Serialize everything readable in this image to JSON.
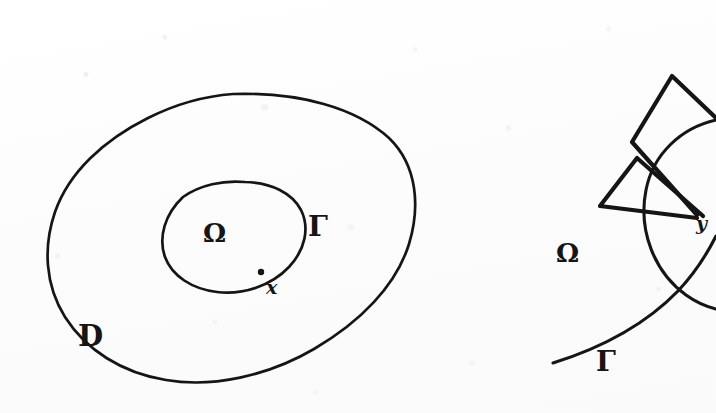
{
  "figure": {
    "background_color": "#fdfdfd",
    "ink_color": "#151515",
    "width": 716,
    "height": 413
  },
  "left_panel": {
    "name": "domain-overview",
    "labels": {
      "outer_domain": "D",
      "inner_domain": "Ω",
      "boundary": "Γ",
      "boundary_point": "x"
    },
    "label_positions": {
      "outer_domain": {
        "x": 78,
        "y": 322
      },
      "inner_domain": {
        "x": 203,
        "y": 220
      },
      "boundary": {
        "x": 308,
        "y": 213
      },
      "boundary_point": {
        "x": 266,
        "y": 278
      }
    },
    "shapes": [
      {
        "name": "outer-blob-D",
        "kind": "closed-freehand-curve",
        "description": "large irregular closed oval representing the domain D",
        "path": "M 233 94 C 300 92 356 108 389 138 C 418 166 420 208 409 244 C 396 286 360 322 314 349 C 268 376 212 388 166 380 C 122 373 86 350 65 317 C 45 285 43 247 55 212 C 69 172 104 140 148 118 C 176 104 205 96 233 94 Z"
      },
      {
        "name": "inner-ellipse-omega",
        "kind": "closed-freehand-curve",
        "description": "tilted inner closed oval whose boundary is Γ and interior is Ω",
        "path": "M 245 182 C 272 183 292 193 301 210 C 310 228 305 250 289 267 C 271 286 243 295 217 292 C 192 289 172 276 165 257 C 158 237 165 214 183 197 C 200 185 223 180 245 182 Z"
      },
      {
        "name": "boundary-point-dot-x",
        "kind": "dot",
        "description": "filled dot marking the point x sitting on the curve Γ",
        "cx": 261,
        "cy": 272,
        "r": 3.2
      }
    ]
  },
  "right_panel": {
    "name": "cone-condition-detail",
    "labels": {
      "domain": "Ω",
      "boundary": "Γ",
      "vertex_point": "y"
    },
    "label_positions": {
      "domain": {
        "x": 556,
        "y": 240
      },
      "boundary": {
        "x": 596,
        "y": 348
      },
      "vertex_point": {
        "x": 696,
        "y": 214
      }
    },
    "shapes": [
      {
        "name": "upper-cone-wedge",
        "kind": "closed-polygon-freehand",
        "description": "upper truncated cone / wedge with apex near the point y",
        "path": "M 697 215 L 632 142 L 672 76 L 716 118"
      },
      {
        "name": "lower-cone-wedge",
        "kind": "closed-polygon-freehand",
        "description": "lower-left truncated cone / wedge with apex near the point y",
        "path": "M 697 218 L 600 206 L 637 158 L 703 216"
      },
      {
        "name": "circle-arc-neighbourhood",
        "kind": "open-arc",
        "description": "circular arc of a small ball centred near the boundary point y",
        "path": "M 716 120 C 681 128 653 154 646 190 C 638 230 654 272 686 295 C 697 303 708 307 716 309"
      },
      {
        "name": "boundary-curve-gamma",
        "kind": "open-freehand-curve",
        "description": "the boundary curve Γ sweeping from lower-left up to the right",
        "path": "M 553 363 C 601 348 645 325 678 291 C 694 274 706 256 716 236"
      }
    ]
  }
}
